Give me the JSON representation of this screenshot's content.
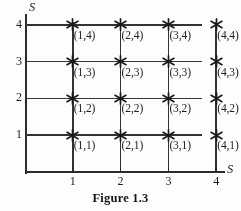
{
  "figure": {
    "caption": "Figure 1.3",
    "axis_label_x": "S",
    "axis_label_y": "S",
    "marker_icon": "asterisk-star-icon",
    "line_color": "#2b2b2b",
    "grid_color": "#333333",
    "text_color": "#1d1d1d",
    "background_color": "#fdfdfd"
  },
  "chart_data": {
    "type": "scatter",
    "title": "Figure 1.3",
    "xlabel": "S",
    "ylabel": "S",
    "xlim": [
      0,
      5
    ],
    "ylim": [
      0,
      5
    ],
    "grid": true,
    "legend": false,
    "xticks": [
      "1",
      "2",
      "3",
      "4"
    ],
    "yticks": [
      "1",
      "2",
      "3",
      "4"
    ],
    "xtick_values": [
      1,
      2,
      3,
      4
    ],
    "ytick_values": [
      1,
      2,
      3,
      4
    ],
    "marker": "asterisk",
    "points": [
      {
        "x": 1,
        "y": 4,
        "label": "(1,4)"
      },
      {
        "x": 2,
        "y": 4,
        "label": "(2,4)"
      },
      {
        "x": 3,
        "y": 4,
        "label": "(3,4)"
      },
      {
        "x": 4,
        "y": 4,
        "label": "(4,4)"
      },
      {
        "x": 1,
        "y": 3,
        "label": "(1,3)"
      },
      {
        "x": 2,
        "y": 3,
        "label": "(2,3)"
      },
      {
        "x": 3,
        "y": 3,
        "label": "(3,3)"
      },
      {
        "x": 4,
        "y": 3,
        "label": "(4,3)"
      },
      {
        "x": 1,
        "y": 2,
        "label": "(1,2)"
      },
      {
        "x": 2,
        "y": 2,
        "label": "(2,2)"
      },
      {
        "x": 3,
        "y": 2,
        "label": "(3,2)"
      },
      {
        "x": 4,
        "y": 2,
        "label": "(4,2)"
      },
      {
        "x": 1,
        "y": 1,
        "label": "(1,1)"
      },
      {
        "x": 2,
        "y": 1,
        "label": "(2,1)"
      },
      {
        "x": 3,
        "y": 1,
        "label": "(3,1)"
      },
      {
        "x": 4,
        "y": 1,
        "label": "(4,1)"
      }
    ]
  }
}
